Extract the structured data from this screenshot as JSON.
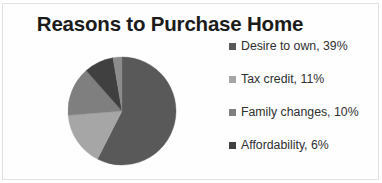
{
  "chart_data": {
    "type": "pie",
    "title": "Reasons to Purchase Home",
    "xlabel": "",
    "ylabel": "",
    "legend_position": "right",
    "grid": false,
    "categories": [
      "Desire to own",
      "Tax credit",
      "Family changes",
      "Affordability"
    ],
    "values": [
      39,
      11,
      10,
      6
    ],
    "value_unit": "%",
    "legend_entries": [
      "Desire to own, 39%",
      "Tax credit, 11%",
      "Family changes, 10%",
      "Affordability, 6%"
    ],
    "slice_colors": [
      "#595959",
      "#a6a6a6",
      "#7f7f7f",
      "#404040"
    ],
    "slices": [
      {
        "label": "Desire to own",
        "value": 39,
        "display": "39%",
        "color": "#595959",
        "start_angle": 0,
        "sweep_angle": 207.0
      },
      {
        "label": "Tax credit",
        "value": 11,
        "display": "11%",
        "color": "#a6a6a6",
        "start_angle": 207.0,
        "sweep_angle": 58.4
      },
      {
        "label": "Family changes",
        "value": 10,
        "display": "10%",
        "color": "#7f7f7f",
        "start_angle": 265.4,
        "sweep_angle": 53.1
      },
      {
        "label": "Affordability",
        "value": 6,
        "display": "6%",
        "color": "#404040",
        "start_angle": 318.5,
        "sweep_angle": 31.9
      },
      {
        "label": "Other",
        "value": 1.6,
        "display": "",
        "color": "#8c8c8c",
        "start_angle": 350.4,
        "sweep_angle": 9.6
      }
    ]
  },
  "legend": {
    "items": [
      {
        "label": "Desire to own, 39%",
        "color": "#595959"
      },
      {
        "label": "Tax credit, 11%",
        "color": "#a6a6a6"
      },
      {
        "label": "Family changes, 10%",
        "color": "#7f7f7f"
      },
      {
        "label": "Affordability, 6%",
        "color": "#404040"
      }
    ]
  }
}
